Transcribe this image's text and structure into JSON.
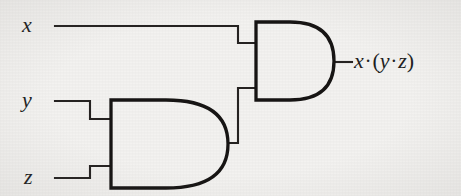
{
  "figure": {
    "kind": "logic-circuit-diagram",
    "width": 461,
    "height": 196,
    "background_color": "#f3f2f0",
    "ink_color": "#221f1f"
  },
  "labels": {
    "input_x": "x",
    "input_y": "y",
    "input_z": "z",
    "output_expression": "x·(y·z)",
    "output_parts": {
      "lhs": "x",
      "dot1": "·",
      "open_paren": "(",
      "y": "y",
      "dot2": "·",
      "z": "z",
      "close_paren": ")"
    }
  },
  "gates": [
    {
      "id": "and-gate-inner",
      "type": "AND",
      "label": "lower AND gate",
      "inputs": [
        "y",
        "z"
      ],
      "output": "y·z",
      "x": 110,
      "y": 100,
      "width": 115,
      "height": 88
    },
    {
      "id": "and-gate-outer",
      "type": "AND",
      "label": "upper AND gate",
      "inputs": [
        "x",
        "y·z"
      ],
      "output": "x·(y·z)",
      "x": 255,
      "y": 22,
      "width": 75,
      "height": 78
    }
  ],
  "wires": [
    {
      "id": "wire-x",
      "from": "input x",
      "to": "and-gate-outer input 1"
    },
    {
      "id": "wire-y",
      "from": "input y",
      "to": "and-gate-inner input 1"
    },
    {
      "id": "wire-z",
      "from": "input z",
      "to": "and-gate-inner input 2"
    },
    {
      "id": "wire-inner",
      "from": "and-gate-inner",
      "to": "and-gate-outer input 2"
    },
    {
      "id": "wire-out",
      "from": "and-gate-outer",
      "to": "output label"
    }
  ]
}
